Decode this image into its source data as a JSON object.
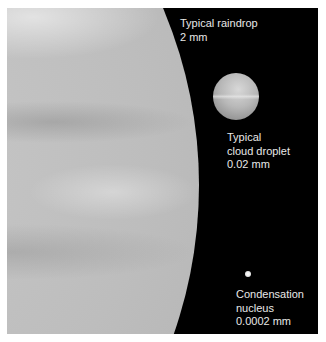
{
  "figure": {
    "labels": {
      "raindrop": {
        "line1": "Typical raindrop",
        "line2": "2 mm"
      },
      "cloud_droplet": {
        "line1": "Typical",
        "line2": "cloud droplet",
        "line3": "0.02 mm"
      },
      "nucleus": {
        "line1": "Condensation",
        "line2": "nucleus",
        "line3": "0.0002 mm"
      }
    },
    "colors": {
      "background": "#000000",
      "label_text": "#e8e8e8",
      "drop_fill": "#c0c0c0"
    }
  }
}
